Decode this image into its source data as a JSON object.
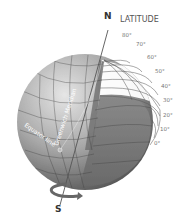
{
  "diagram": {
    "title": "LATITUDE",
    "north_label": "N",
    "south_label": "S",
    "equator_label": "Equator line",
    "meridian_label": "Greenwich Meridian",
    "latitude_ticks": [
      "80°",
      "70°",
      "60°",
      "50°",
      "40°",
      "30°",
      "20°",
      "10°",
      "0°"
    ],
    "colors": {
      "globe_light": "#d8d8d8",
      "globe_mid": "#9a9a9a",
      "globe_dark": "#5e5e5e",
      "grid_line": "#3a3a3a",
      "text": "#555555"
    }
  }
}
